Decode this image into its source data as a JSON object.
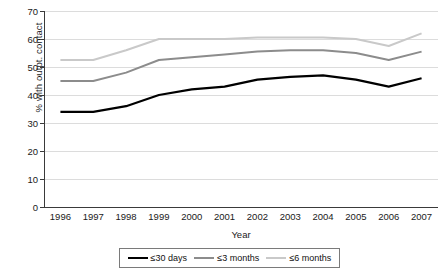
{
  "chart_data": {
    "type": "line",
    "title": "",
    "xlabel": "Year",
    "ylabel": "% with outpt. contact",
    "categories": [
      "1996",
      "1997",
      "1998",
      "1999",
      "2000",
      "2001",
      "2002",
      "2003",
      "2004",
      "2005",
      "2006",
      "2007"
    ],
    "ylim": [
      0,
      70
    ],
    "yticks": [
      0,
      10,
      20,
      30,
      40,
      50,
      60,
      70
    ],
    "ytick_labels": [
      "0",
      "10",
      "20",
      "30",
      "40",
      "50",
      "60",
      "70"
    ],
    "grid": true,
    "legend_position": "bottom",
    "series": [
      {
        "name": "≤30 days",
        "color": "#000000",
        "width": 2.2,
        "values": [
          34,
          34,
          36,
          40,
          42,
          43,
          45.5,
          46.5,
          47,
          45.5,
          43,
          46
        ]
      },
      {
        "name": "≤3 months",
        "color": "#8c8c8c",
        "width": 2.0,
        "values": [
          45,
          45,
          48,
          52.5,
          53.5,
          54.5,
          55.5,
          56,
          56,
          55,
          52.5,
          55.5
        ]
      },
      {
        "name": "≤6 months",
        "color": "#c9c9c9",
        "width": 2.0,
        "values": [
          52.5,
          52.5,
          56,
          60,
          60,
          60,
          60.5,
          60.5,
          60.5,
          60,
          57.5,
          62
        ]
      }
    ]
  },
  "legend": {
    "items": [
      {
        "label": "≤30 days",
        "color": "#000000"
      },
      {
        "label": "≤3 months",
        "color": "#8c8c8c"
      },
      {
        "label": "≤6 months",
        "color": "#c9c9c9"
      }
    ]
  },
  "axes": {
    "y_title": "% with outpt. contact",
    "x_title": "Year"
  }
}
